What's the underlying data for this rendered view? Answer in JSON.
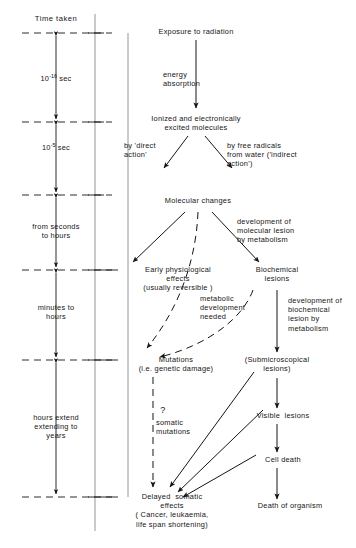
{
  "diagram": {
    "axis": {
      "header": "Time taken",
      "intervals": [
        {
          "id": "int-1",
          "label": "10⁻¹⁶ sec",
          "base": "10",
          "exponent": "-16",
          "unit": "sec"
        },
        {
          "id": "int-2",
          "label": "10⁻⁵ sec",
          "base": "10",
          "exponent": "-5",
          "unit": "sec"
        },
        {
          "id": "int-3",
          "label": "from seconds\nto hours"
        },
        {
          "id": "int-4",
          "label": "minutes to\nhours"
        },
        {
          "id": "int-5",
          "label": "hours extend\nextending to\nyears"
        }
      ],
      "tick_count": 6
    },
    "nodes": [
      {
        "id": "exposure",
        "label": "Exposure to radiation"
      },
      {
        "id": "ionized",
        "label": "Ionized and electronically\nexcited molecules"
      },
      {
        "id": "molecular",
        "label": "Molecular changes"
      },
      {
        "id": "early",
        "label": "Early physiological\neffects\n(usually reversible )"
      },
      {
        "id": "biochem",
        "label": "Biochemical\nlesions"
      },
      {
        "id": "mutations",
        "label": "Mutations\n(i.e. genetic damage)"
      },
      {
        "id": "submicro",
        "label": "(Submicroscopical\nlesions)"
      },
      {
        "id": "visible",
        "label": "Visible  lesions"
      },
      {
        "id": "celldeath",
        "label": "Cell death"
      },
      {
        "id": "deathorg",
        "label": "Death of organism"
      },
      {
        "id": "delayed",
        "label": "Delayed  somatic\neffects\n( Cancer, leukaemia,\nlife span shortening)"
      }
    ],
    "edge_labels": [
      {
        "id": "energy-absorption",
        "label": "energy\nabsorption"
      },
      {
        "id": "direct-action",
        "label": "by 'direct\naction'"
      },
      {
        "id": "indirect-action",
        "label": "by free radicals\nfrom water ('indirect\naction')"
      },
      {
        "id": "dev-molecular",
        "label": "development of\nmolecular lesion\nby metabolism"
      },
      {
        "id": "metabolic-dev",
        "label": "metabolic\ndevelopment\nneeded"
      },
      {
        "id": "dev-biochemical",
        "label": "development of\nbiochemical\nlesion by\nmetabolism"
      },
      {
        "id": "somatic-mutations",
        "label": "somatic\nmutations"
      },
      {
        "id": "question-mark",
        "label": "?"
      }
    ],
    "colors": {
      "ink": "#151515",
      "rule": "#8a8a8a",
      "background": "#ffffff"
    }
  }
}
